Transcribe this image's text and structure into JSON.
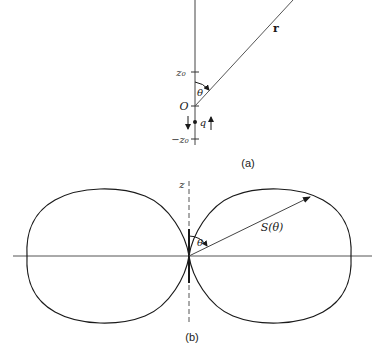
{
  "figure_a": {
    "caption": "(a)",
    "vector_label": "r",
    "angle_label": "θ",
    "origin_label": "O",
    "charge_label": "q",
    "tick_top_label": "z₀",
    "tick_bottom_label": "−z₀"
  },
  "figure_b": {
    "caption": "(b)",
    "axis_label": "z",
    "angle_label": "θ",
    "radius_label": "S(θ)"
  },
  "colors": {
    "ink": "#1a1a1a",
    "thin_line": "#555555",
    "background": "#ffffff"
  }
}
